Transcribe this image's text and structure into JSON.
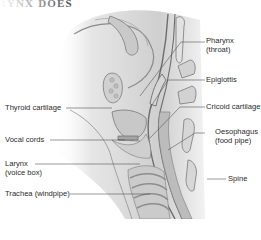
{
  "title": "RYNX DOES",
  "diagram": {
    "labels_right": [
      {
        "id": "pharynx",
        "line1": "Pharynx",
        "line2": "(throat)"
      },
      {
        "id": "epiglottis",
        "line1": "Epiglottis",
        "line2": ""
      },
      {
        "id": "cricoid",
        "line1": "Cricoid cartilage",
        "line2": ""
      },
      {
        "id": "oesophagus",
        "line1": "Oesophagus",
        "line2": "(food pipe)"
      },
      {
        "id": "spine",
        "line1": "Spine",
        "line2": ""
      }
    ],
    "labels_left": [
      {
        "id": "thyroid",
        "line1": "Thyroid cartilage",
        "line2": ""
      },
      {
        "id": "vocal",
        "line1": "Vocal cords",
        "line2": ""
      },
      {
        "id": "larynx",
        "line1": "Larynx",
        "line2": "(voice box)"
      },
      {
        "id": "trachea",
        "line1": "Trachea (windpipe)",
        "line2": ""
      }
    ],
    "colors": {
      "tissue": "#d8d8d8",
      "tissue_dark": "#a9a9a9",
      "outline": "#6d6d6d",
      "leader": "#555555"
    }
  }
}
